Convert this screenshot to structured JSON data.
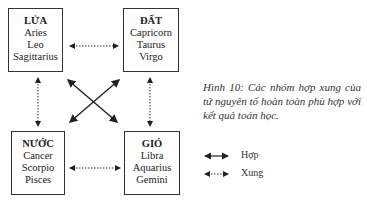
{
  "groups": [
    {
      "title": "LỬA",
      "signs": [
        "Aries",
        "Leo",
        "Sagittarius"
      ]
    },
    {
      "title": "ĐẤT",
      "signs": [
        "Capricorn",
        "Taurus",
        "Virgo"
      ]
    },
    {
      "title": "NƯỚC",
      "signs": [
        "Cancer",
        "Scorpio",
        "Pisces"
      ]
    },
    {
      "title": "GIÓ",
      "signs": [
        "Libra",
        "Aquarius",
        "Gemini"
      ]
    }
  ],
  "caption": "Hình 10: Các nhóm hợp xung của tứ nguyên tố hoàn toàn phù hợp với kết quả toán học.",
  "legend": {
    "compatible": "Hợp",
    "conflict": "Xung"
  }
}
